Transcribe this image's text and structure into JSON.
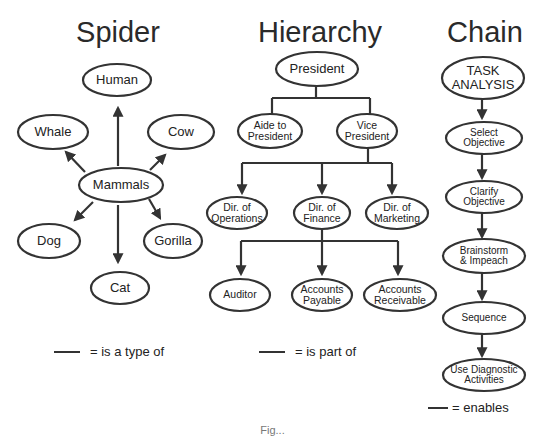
{
  "spider": {
    "title": "Spider",
    "center": "Mammals",
    "nodes": [
      "Human",
      "Whale",
      "Cow",
      "Dog",
      "Gorilla",
      "Cat"
    ],
    "legend": "= is a type of"
  },
  "hierarchy": {
    "title": "Hierarchy",
    "level1": "President",
    "level2": [
      "Aide to\nPresident",
      "Vice\nPresident"
    ],
    "level3": [
      "Dir. of\nOperations",
      "Dir. of\nFinance",
      "Dir. of\nMarketing"
    ],
    "level4": [
      "Auditor",
      "Accounts\nPayable",
      "Accounts\nReceivable"
    ],
    "legend": "= is part of"
  },
  "chain": {
    "title": "Chain",
    "steps": [
      "TASK\nANALYSIS",
      "Select\nObjective",
      "Clarify\nObjective",
      "Brainstorm\n& Impeach",
      "Sequence",
      "Use Diagnostic\nActivities"
    ],
    "legend": "= enables"
  },
  "caption": "Fig..."
}
